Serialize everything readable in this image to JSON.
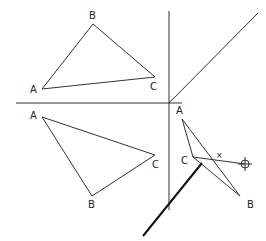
{
  "diagram": {
    "type": "descriptive-geometry-projection",
    "colors": {
      "line": "#333333",
      "thick_line": "#111111",
      "background": "#ffffff"
    },
    "axes": {
      "horizontal": {
        "x1": 16,
        "y1": 103,
        "x2": 182,
        "y2": 103
      },
      "vertical": {
        "x1": 169,
        "y1": 11,
        "x2": 169,
        "y2": 210
      },
      "diagonal_45": {
        "x1": 169,
        "y1": 103,
        "x2": 258,
        "y2": 13
      }
    },
    "top_view": {
      "vertices": [
        {
          "label": "A",
          "x": 42,
          "y": 89,
          "lx": 30,
          "ly": 93
        },
        {
          "label": "B",
          "x": 93,
          "y": 24,
          "lx": 89,
          "ly": 19
        },
        {
          "label": "C",
          "x": 155,
          "y": 77,
          "lx": 150,
          "ly": 90
        }
      ]
    },
    "front_view": {
      "vertices": [
        {
          "label": "A",
          "x": 42,
          "y": 117,
          "lx": 30,
          "ly": 119
        },
        {
          "label": "B",
          "x": 92,
          "y": 196,
          "lx": 88,
          "ly": 208
        },
        {
          "label": "C",
          "x": 155,
          "y": 155,
          "lx": 152,
          "ly": 168
        }
      ]
    },
    "side_view": {
      "vertices": [
        {
          "label": "A",
          "x": 182,
          "y": 119,
          "lx": 176,
          "ly": 114
        },
        {
          "label": "C",
          "x": 193,
          "y": 157,
          "lx": 181,
          "ly": 164
        },
        {
          "label": "B",
          "x": 240,
          "y": 196,
          "lx": 247,
          "ly": 208
        }
      ],
      "ray": {
        "x1": 193,
        "y1": 157,
        "x2": 245,
        "y2": 164
      },
      "crosshair": {
        "x": 245,
        "y": 164,
        "r": 4
      },
      "intersection_marker": {
        "label": "×",
        "x": 219,
        "y": 158
      }
    },
    "thick_line": {
      "x1": 143,
      "y1": 236,
      "x2": 202,
      "y2": 163
    }
  }
}
